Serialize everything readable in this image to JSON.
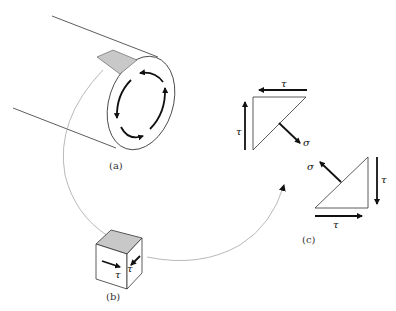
{
  "figure": {
    "panels": [
      {
        "id": "a",
        "label": "(a)",
        "description": "Hollow cylinder (tube) under torsion with circulating shear stress arrows on end face"
      },
      {
        "id": "b",
        "label": "(b)",
        "description": "Small cube element cut from tube surface with shear stresses"
      },
      {
        "id": "c",
        "label": "(c)",
        "description": "Two triangular free-body wedges showing shear and normal stress on a 45° plane"
      }
    ],
    "symbols": {
      "shear": "τ",
      "normal": "σ"
    },
    "colors": {
      "line": "#222222",
      "shaded_face": "#c8c8c8",
      "connector": "#999999"
    }
  }
}
